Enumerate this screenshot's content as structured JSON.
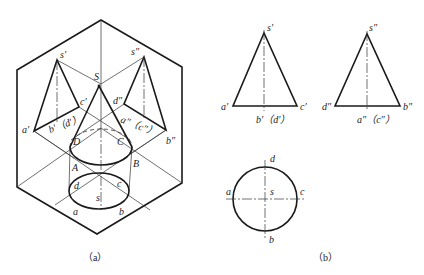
{
  "figure_a": {
    "caption": "（a）",
    "labels": {
      "S": "S",
      "s_prime": "s′",
      "s_double": "s″",
      "a_prime": "a′",
      "c_prime": "c′",
      "b_prime_d_prime": "b′（d′）",
      "d_double": "d″",
      "a_double_c_double": "a″（c″）",
      "b_double": "b″",
      "D": "D",
      "C": "C",
      "A": "A",
      "B": "B",
      "d": "d",
      "c": "c",
      "s": "s",
      "a": "a",
      "b": "b"
    }
  },
  "figure_b": {
    "caption": "（b）",
    "front_view": {
      "apex": "s′",
      "left": "a′",
      "right": "c′",
      "bottom": "b′（d′）"
    },
    "side_view": {
      "apex": "s″",
      "left": "d″",
      "right": "b″",
      "bottom": "a″（c″）"
    },
    "top_view": {
      "top": "d",
      "left": "a",
      "center": "s",
      "right": "c",
      "bottom": "b"
    }
  }
}
